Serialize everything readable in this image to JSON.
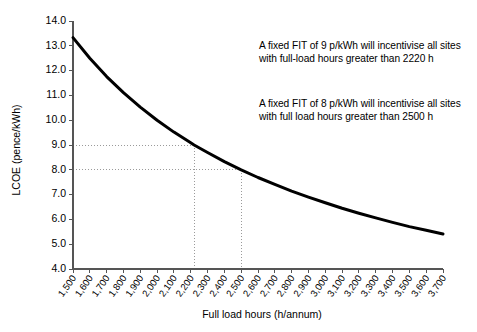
{
  "chart_data": {
    "type": "line",
    "title": "",
    "xlabel": "Full load hours (h/annum)",
    "ylabel": "LCOE (pence/kWh)",
    "xlim": [
      1500,
      3700
    ],
    "ylim": [
      4.0,
      14.0
    ],
    "grid": false,
    "legend": null,
    "x_tick_labels": [
      "1,500",
      "1,600",
      "1,700",
      "1,800",
      "1,900",
      "2,000",
      "2,100",
      "2,200",
      "2,300",
      "2,400",
      "2,500",
      "2,600",
      "2,700",
      "2,800",
      "2,900",
      "3,000",
      "3,100",
      "3,200",
      "3,300",
      "3,400",
      "3,500",
      "3,600",
      "3,700"
    ],
    "y_tick_labels": [
      "4.0",
      "5.0",
      "6.0",
      "7.0",
      "8.0",
      "9.0",
      "10.0",
      "11.0",
      "12.0",
      "13.0",
      "14.0"
    ],
    "x": [
      1500,
      1600,
      1700,
      1800,
      1900,
      2000,
      2100,
      2200,
      2220,
      2300,
      2400,
      2500,
      2600,
      2700,
      2800,
      2900,
      3000,
      3100,
      3200,
      3300,
      3400,
      3500,
      3600,
      3700
    ],
    "series": [
      {
        "name": "LCOE",
        "values": [
          13.33,
          12.5,
          11.76,
          11.11,
          10.53,
          10.0,
          9.52,
          9.09,
          9.0,
          8.7,
          8.33,
          8.0,
          7.69,
          7.41,
          7.14,
          6.9,
          6.67,
          6.45,
          6.25,
          6.06,
          5.88,
          5.71,
          5.56,
          5.41
        ],
        "color": "#000000"
      }
    ],
    "annotations": [
      {
        "name": "fit-9-note",
        "text": "A fixed FIT of 9 p/kWh will incentivise all sites with full-load hours greater than 2220 h"
      },
      {
        "name": "fit-8-note",
        "text": "A fixed FIT of 8 p/kWh will incentivise all sites with full load hours greater than 2500 h"
      }
    ],
    "guide_lines": [
      {
        "name": "guide-9-pence",
        "y_value": 9.0,
        "x_value": 2220
      },
      {
        "name": "guide-8-pence",
        "y_value": 8.0,
        "x_value": 2500
      }
    ],
    "colors": {
      "curve": "#000000",
      "axis": "#555555",
      "guide": "#9a9a9a",
      "background": "#ffffff"
    }
  }
}
